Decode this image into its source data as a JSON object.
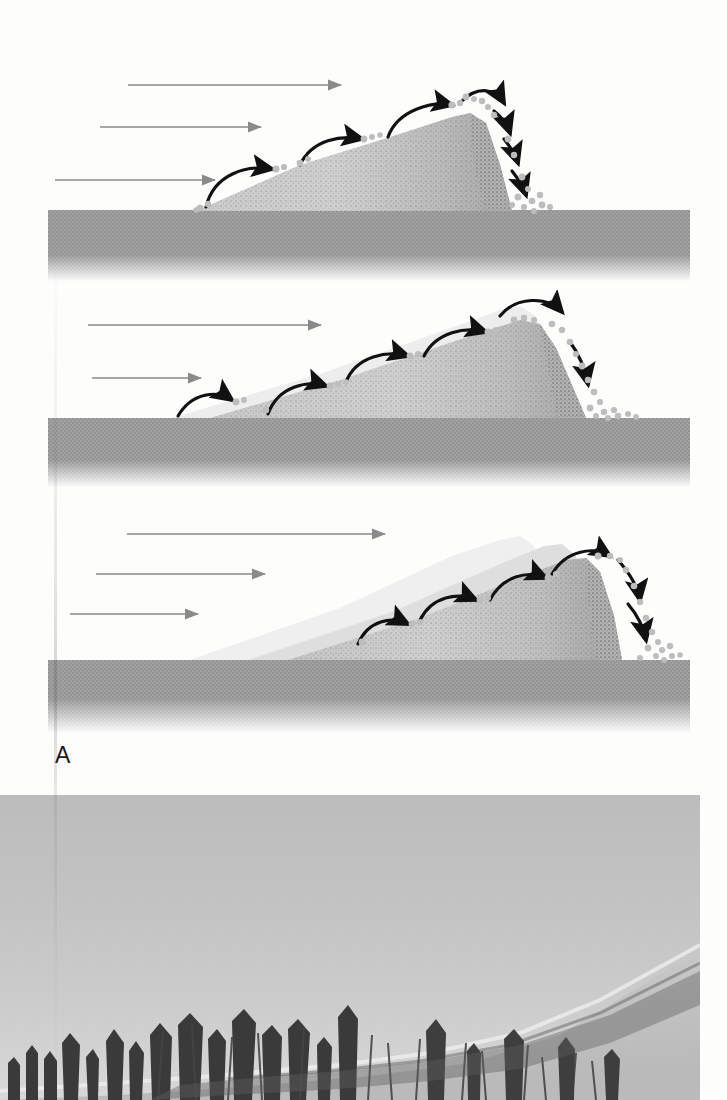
{
  "figure": {
    "label": "A",
    "type": "dune-migration-diagram-with-photo",
    "panel_count": 3
  },
  "colors": {
    "page_background": "#fdfdfc",
    "ground_band": "#9b9b9b",
    "dune_light": "#c9c9c9",
    "dune_mid": "#b0b0b0",
    "dune_dark": "#8e8e8e",
    "ghost_dune": "#e3e3e3",
    "ghost_dune_2": "#d6d6d6",
    "wind_arrow": "#8a8a8a",
    "saltation_arrow": "#111111",
    "sand_grain": "#bdbdbd",
    "photo_sky": "#c6c6c6",
    "photo_sand": "#d3d3d3",
    "photo_trees": "#3a3a3a"
  },
  "panels": [
    {
      "id": "panel-1",
      "name": "dune-stage-1",
      "ground_label": "substrate",
      "wind_arrows": [
        {
          "name": "wind-arrow-top",
          "x1": 128,
          "y1": 85,
          "x2": 348,
          "y2": 85
        },
        {
          "name": "wind-arrow-middle",
          "x1": 100,
          "y1": 128,
          "x2": 268,
          "y2": 128
        },
        {
          "name": "wind-arrow-lower",
          "x1": 55,
          "y1": 180,
          "x2": 222,
          "y2": 180
        }
      ],
      "saltation_arrows": 4,
      "grain_clusters": 6,
      "ghost_outlines": 0
    },
    {
      "id": "panel-2",
      "name": "dune-stage-2",
      "wind_arrows": [
        {
          "name": "wind-arrow-top",
          "x1": 88,
          "y1": 325,
          "x2": 328,
          "y2": 325
        },
        {
          "name": "wind-arrow-middle",
          "x1": 92,
          "y1": 378,
          "x2": 208,
          "y2": 378
        }
      ],
      "saltation_arrows": 5,
      "grain_clusters": 8,
      "ghost_outlines": 1
    },
    {
      "id": "panel-3",
      "name": "dune-stage-3",
      "wind_arrows": [
        {
          "name": "wind-arrow-top",
          "x1": 127,
          "y1": 535,
          "x2": 392,
          "y2": 535
        },
        {
          "name": "wind-arrow-middle",
          "x1": 96,
          "y1": 595,
          "x2": 272,
          "y2": 595
        },
        {
          "name": "wind-arrow-lower",
          "x1": 70,
          "y1": 655,
          "x2": 205,
          "y2": 655
        }
      ],
      "saltation_arrows": 5,
      "grain_clusters": 5,
      "ghost_outlines": 2
    }
  ],
  "photo": {
    "name": "dune-advancing-over-forest-photograph",
    "scene": "pale sky above a sand dune ridge rising to the right, with bare dead trees silhouetted along the lower edge",
    "sky_tone": "light gray",
    "subjects": [
      "sky",
      "dune-ridge",
      "dead-trees",
      "sand-slope"
    ]
  }
}
